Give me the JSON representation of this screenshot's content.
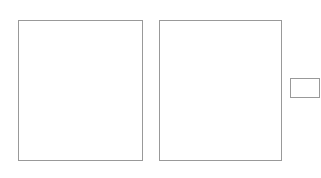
{
  "game": "backgammon",
  "colors": {
    "light_point": "#ffffff",
    "dark_point": "#d3d3d3",
    "border": "#888888",
    "black_checker": "#111111",
    "white_checker": "#ffffff"
  },
  "top_labels": [
    "24",
    "23",
    "22",
    "21",
    "20",
    "19",
    "18",
    "17",
    "16",
    "15",
    "14",
    "13"
  ],
  "bottom_labels": [
    "1",
    "2",
    "3",
    "4",
    "5",
    "6",
    "7",
    "8",
    "9",
    "10",
    "11",
    "12"
  ],
  "points": {
    "1": {
      "color": "black",
      "count": 2
    },
    "2": {
      "color": null,
      "count": 0
    },
    "3": {
      "color": "white",
      "count": 2
    },
    "4": {
      "color": "black",
      "count": 2
    },
    "5": {
      "color": "white",
      "count": 2
    },
    "6": {
      "color": "black",
      "count": 2
    },
    "7": {
      "color": "black",
      "count": 2
    },
    "8": {
      "color": "black",
      "count": 3
    },
    "9": {
      "color": null,
      "count": 0
    },
    "10": {
      "color": null,
      "count": 0
    },
    "11": {
      "color": "black",
      "count": 3
    },
    "12": {
      "color": "white",
      "count": 2
    },
    "13": {
      "color": null,
      "count": 0
    },
    "14": {
      "color": null,
      "count": 0
    },
    "15": {
      "color": null,
      "count": 0
    },
    "16": {
      "color": null,
      "count": 0
    },
    "17": {
      "color": "white",
      "count": 1
    },
    "18": {
      "color": "white",
      "count": 1
    },
    "19": {
      "color": "white",
      "count": 3
    },
    "20": {
      "color": "black",
      "count": 1
    },
    "21": {
      "color": "white",
      "count": 2
    },
    "22": {
      "color": "white",
      "count": 2
    },
    "23": {
      "color": null,
      "count": 0
    },
    "24": {
      "color": null,
      "count": 0
    }
  },
  "cube_box": {
    "label": ""
  }
}
